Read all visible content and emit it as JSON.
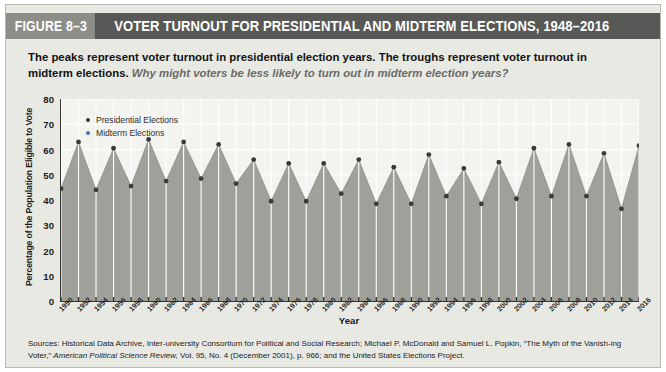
{
  "figure": {
    "tag": "FIGURE 8–3",
    "title": "VOTER TURNOUT FOR PRESIDENTIAL AND MIDTERM ELECTIONS, 1948–2016"
  },
  "subtitle": {
    "bold": "The peaks represent voter turnout in presidential election years. The troughs represent voter turnout in midterm elections.",
    "prompt": "Why might voters be less likely to turn out in midterm election years?"
  },
  "legend": {
    "position": "inside-top-left",
    "items": [
      {
        "label": "Presidential Elections",
        "color": "#3a3a38",
        "marker": "dot"
      },
      {
        "label": "Midterm Elections",
        "color": "#4a6fa8",
        "marker": "dot"
      }
    ]
  },
  "sources": {
    "line1_a": "Sources: Historical Data Archive, Inter-university Consortium for Political and Social Research; Michael P. McDonald and Samuel L. Popkin, “The Myth of the Vanish-",
    "line2_a": "ing Voter,” ",
    "line2_ital": "American Political Science Review,",
    "line2_b": " Vol. 95, No. 4 (December 2001), p. 966; and the United States Elections Project."
  },
  "colors": {
    "title_bar": "#585856",
    "tag_bar": "#8d8d88",
    "panel_bg": "#e9e9e4",
    "plot_bg": "#f3f3f0",
    "area_fill": "#a0a09b",
    "gridline": "#ffffff",
    "axis": "#333330",
    "presidential_marker": "#3a3a38",
    "midterm_marker": "#4a6fa8"
  },
  "chart_data": {
    "type": "area",
    "title": "VOTER TURNOUT FOR PRESIDENTIAL AND MIDTERM ELECTIONS, 1948–2016",
    "xlabel": "Year",
    "ylabel": "Percentage of the Population Eligible to Vote",
    "ylim": [
      0,
      80
    ],
    "yticks": [
      0,
      10,
      20,
      30,
      40,
      50,
      60,
      70,
      80
    ],
    "xlim": [
      1950,
      2016
    ],
    "grid": "vertical-and-horizontal-white",
    "x": [
      1950,
      1952,
      1954,
      1956,
      1958,
      1960,
      1962,
      1964,
      1966,
      1968,
      1970,
      1972,
      1974,
      1976,
      1978,
      1980,
      1982,
      1984,
      1986,
      1988,
      1990,
      1992,
      1994,
      1996,
      1998,
      2000,
      2002,
      2004,
      2006,
      2008,
      2010,
      2012,
      2014,
      2016
    ],
    "xticklabels": [
      "1950",
      "1952",
      "1954",
      "1956",
      "1958",
      "1960",
      "1962",
      "1964",
      "1966",
      "1968",
      "1970",
      "1972",
      "1974",
      "1976",
      "1978",
      "1980",
      "1982",
      "1984",
      "1986",
      "1988",
      "1990",
      "1992",
      "1994",
      "1996",
      "1998",
      "2000",
      "2002",
      "2004",
      "2006",
      "2008",
      "2010",
      "2012",
      "2014",
      "2016"
    ],
    "values": [
      44.5,
      63.0,
      44.0,
      60.5,
      45.5,
      64.0,
      47.5,
      63.0,
      48.5,
      62.0,
      46.5,
      56.0,
      39.5,
      54.5,
      39.5,
      54.5,
      42.5,
      56.0,
      38.5,
      53.0,
      38.5,
      58.0,
      41.5,
      52.5,
      38.5,
      55.0,
      40.5,
      60.5,
      41.5,
      62.0,
      41.5,
      58.5,
      36.5,
      61.5
    ],
    "series": [
      {
        "name": "Presidential Elections",
        "color": "#3a3a38",
        "x": [
          1952,
          1956,
          1960,
          1964,
          1968,
          1972,
          1976,
          1980,
          1984,
          1988,
          1992,
          1996,
          2000,
          2004,
          2008,
          2012,
          2016
        ],
        "values": [
          63.0,
          60.5,
          64.0,
          63.0,
          62.0,
          56.0,
          54.5,
          54.5,
          56.0,
          53.0,
          58.0,
          52.5,
          55.0,
          60.5,
          62.0,
          58.5,
          61.5
        ]
      },
      {
        "name": "Midterm Elections",
        "color": "#4a6fa8",
        "x": [
          1950,
          1954,
          1958,
          1962,
          1966,
          1970,
          1974,
          1978,
          1982,
          1986,
          1990,
          1994,
          1998,
          2002,
          2006,
          2010,
          2014
        ],
        "values": [
          44.5,
          44.0,
          45.5,
          47.5,
          48.5,
          46.5,
          39.5,
          39.5,
          42.5,
          38.5,
          38.5,
          41.5,
          38.5,
          40.5,
          41.5,
          41.5,
          36.5
        ]
      }
    ]
  }
}
